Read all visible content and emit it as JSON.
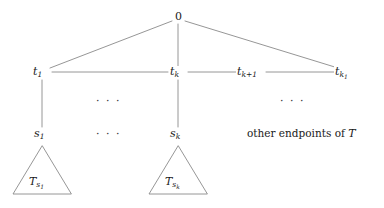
{
  "figure": {
    "type": "tree-diagram",
    "background": "#ffffff",
    "line_color": "#8a8a8a",
    "text_color": "#1a1a1a"
  },
  "nodes": {
    "root": {
      "label": "0",
      "x": 178,
      "y": 17
    },
    "t1": {
      "label_base": "t",
      "sub": "1",
      "x": 42,
      "y": 73
    },
    "tk": {
      "label_base": "t",
      "sub": "k",
      "x": 178,
      "y": 73
    },
    "tk1": {
      "label_base": "t",
      "sub": "k+1",
      "x": 250,
      "y": 73
    },
    "tkl": {
      "label_base": "t",
      "sub": "k",
      "sub2": "1",
      "x": 345,
      "y": 73
    },
    "s1": {
      "label_base": "s",
      "sub": "1",
      "x": 42,
      "y": 134
    },
    "sk": {
      "label_base": "s",
      "sub": "k",
      "x": 178,
      "y": 134
    }
  },
  "labels": {
    "root": "0",
    "t1": "t₁",
    "tk": "t_k",
    "tk_plus_1": "t_{k+1}",
    "tk_sub1": "t_{k_1}",
    "s1": "s₁",
    "sk": "s_k",
    "triangle_left": "T_{s_1}",
    "triangle_right": "T_{s_k}",
    "caption": "other endpoints of",
    "caption_symbol": "T",
    "ellipsis": "· · ·"
  },
  "ellipses": [
    {
      "name": "ellipsis-upper-left",
      "text": "· · ·",
      "x": 104,
      "y": 101
    },
    {
      "name": "ellipsis-upper-right",
      "text": "· · ·",
      "x": 288,
      "y": 101
    },
    {
      "name": "ellipsis-lower-left",
      "text": "· · ·",
      "x": 104,
      "y": 131
    }
  ],
  "triangles": [
    {
      "name": "subtree-s1",
      "label_base": "T",
      "sub": "s",
      "sub2": "1",
      "apex_x": 42,
      "apex_y": 146,
      "base_y": 194,
      "half_width": 30
    },
    {
      "name": "subtree-sk",
      "label_base": "T",
      "sub": "s",
      "sub2": "k",
      "apex_x": 178,
      "apex_y": 146,
      "base_y": 194,
      "half_width": 30
    }
  ],
  "edges": [
    {
      "name": "edge-root-t1",
      "from": "root",
      "to": "t1"
    },
    {
      "name": "edge-root-tk",
      "from": "root",
      "to": "tk"
    },
    {
      "name": "edge-root-tk1",
      "from": "root",
      "to": "tk_sub1"
    },
    {
      "name": "edge-t1-tk",
      "from": "t1",
      "to": "tk"
    },
    {
      "name": "edge-tk-tkplus1",
      "from": "tk",
      "to": "tk_plus_1"
    },
    {
      "name": "edge-tkplus1-tk1",
      "from": "tk_plus_1",
      "to": "tk_sub1"
    },
    {
      "name": "edge-t1-s1",
      "from": "t1",
      "to": "s1"
    },
    {
      "name": "edge-tk-sk",
      "from": "tk",
      "to": "sk"
    }
  ]
}
